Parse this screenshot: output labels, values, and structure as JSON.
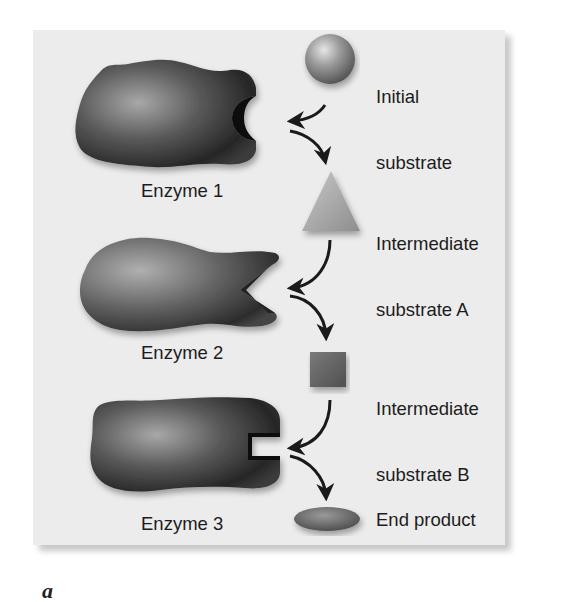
{
  "figure": {
    "panel_letter": "a",
    "colors": {
      "panel_background": "#ececec",
      "enzyme_dark": "#2a2a2a",
      "enzyme_light": "#9a9a9a",
      "arrow": "#1a1a1a",
      "text": "#1c1c1c"
    }
  },
  "enzymes": [
    {
      "label": "Enzyme 1",
      "active_site_shape": "semicircle"
    },
    {
      "label": "Enzyme 2",
      "active_site_shape": "v-notch"
    },
    {
      "label": "Enzyme 3",
      "active_site_shape": "rectangular-notch"
    }
  ],
  "substrates": [
    {
      "label_line1": "Initial",
      "label_line2": "substrate",
      "shape": "sphere"
    },
    {
      "label_line1": "Intermediate",
      "label_line2": "substrate A",
      "shape": "triangle"
    },
    {
      "label_line1": "Intermediate",
      "label_line2": "substrate B",
      "shape": "square"
    },
    {
      "label_line1": "End product",
      "label_line2": "",
      "shape": "ellipse"
    }
  ]
}
